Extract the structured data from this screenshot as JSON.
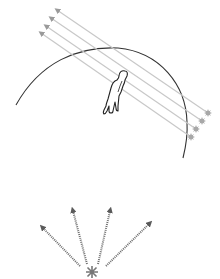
{
  "diagram": {
    "colors": {
      "background": "#ffffff",
      "arc": "#333333",
      "parallel_rays": "#c8c8c8",
      "parallel_arrowheads": "#9a9a9a",
      "source_stars": "#a8a8a8",
      "figure_outline": "#222222",
      "diverging_rays": "#6e6e6e",
      "point_source": "#777777"
    },
    "top_panel": {
      "elements": [
        "horizon-arc",
        "parallel-rays",
        "distant-sources",
        "person-figure"
      ],
      "parallel_ray_count": 4
    },
    "bottom_panel": {
      "elements": [
        "point-source",
        "diverging-rays"
      ],
      "diverging_ray_count": 4
    }
  }
}
